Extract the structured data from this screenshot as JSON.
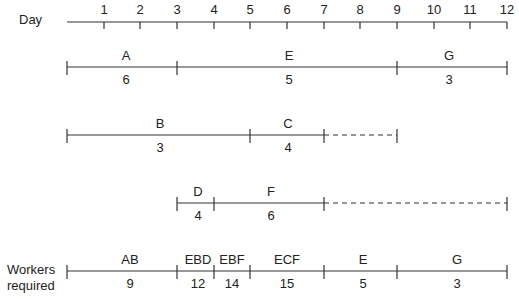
{
  "axis": {
    "label": "Day",
    "ticks": [
      "1",
      "2",
      "3",
      "4",
      "5",
      "6",
      "7",
      "8",
      "9",
      "10",
      "11",
      "12"
    ]
  },
  "rows": [
    {
      "segments": [
        {
          "activity": "A",
          "value": "6",
          "start": 0,
          "end": 3
        },
        {
          "activity": "E",
          "value": "5",
          "start": 3,
          "end": 9
        },
        {
          "activity": "G",
          "value": "3",
          "start": 9,
          "end": 12
        }
      ]
    },
    {
      "segments": [
        {
          "activity": "B",
          "value": "3",
          "start": 0,
          "end": 5
        },
        {
          "activity": "C",
          "value": "4",
          "start": 5,
          "end": 7
        }
      ],
      "float": {
        "start": 7,
        "end": 9
      }
    },
    {
      "segments": [
        {
          "activity": "D",
          "value": "4",
          "start": 3,
          "end": 4
        },
        {
          "activity": "F",
          "value": "6",
          "start": 4,
          "end": 7
        }
      ],
      "float": {
        "start": 7,
        "end": 12
      }
    }
  ],
  "workers": {
    "label_line1": "Workers",
    "label_line2": "required",
    "segments": [
      {
        "activity": "AB",
        "value": "9",
        "start": 0,
        "end": 3
      },
      {
        "activity": "EBD",
        "value": "12",
        "start": 3,
        "end": 4
      },
      {
        "activity": "EBF",
        "value": "14",
        "start": 4,
        "end": 5
      },
      {
        "activity": "ECF",
        "value": "15",
        "start": 5,
        "end": 7
      },
      {
        "activity": "E",
        "value": "5",
        "start": 7,
        "end": 9
      },
      {
        "activity": "G",
        "value": "3",
        "start": 9,
        "end": 12
      }
    ]
  },
  "colors": {
    "line": "#333333",
    "text": "#222222"
  }
}
